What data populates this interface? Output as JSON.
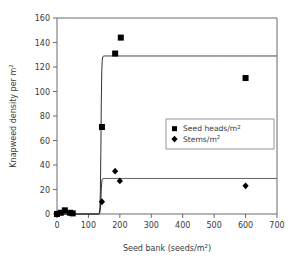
{
  "chart_data": {
    "type": "scatter",
    "title": "",
    "xlabel": "Seed bank (seeds/m2)",
    "xlabel_base": "Seed bank (seeds/m",
    "xlabel_sup": "2",
    "xlabel_tail": ")",
    "ylabel_base": "Knapweed density per m",
    "ylabel_sup": "2",
    "xlim": [
      0,
      700
    ],
    "ylim": [
      0,
      160
    ],
    "xticks": [
      0,
      100,
      200,
      300,
      400,
      500,
      600,
      700
    ],
    "yticks": [
      0,
      20,
      40,
      60,
      80,
      100,
      120,
      140,
      160
    ],
    "grid": false,
    "legend_position": "center-right",
    "series": [
      {
        "name": "Seed heads/m2",
        "name_base": "Seed heads/m",
        "name_sup": "2",
        "marker": "square",
        "color": "#000000",
        "points": [
          {
            "x": 0,
            "y": 0
          },
          {
            "x": 12,
            "y": 1
          },
          {
            "x": 25,
            "y": 3
          },
          {
            "x": 42,
            "y": 1
          },
          {
            "x": 50,
            "y": 0.5
          },
          {
            "x": 143,
            "y": 71
          },
          {
            "x": 185,
            "y": 131
          },
          {
            "x": 203,
            "y": 144
          },
          {
            "x": 600,
            "y": 111
          }
        ],
        "fit_plateau": 129,
        "fit_threshold": 140
      },
      {
        "name": "Stems/m2",
        "name_base": "Stems/m",
        "name_sup": "2",
        "marker": "diamond",
        "color": "#000000",
        "points": [
          {
            "x": 0,
            "y": 0
          },
          {
            "x": 143,
            "y": 10
          },
          {
            "x": 185,
            "y": 35
          },
          {
            "x": 200,
            "y": 27
          },
          {
            "x": 600,
            "y": 23
          }
        ],
        "fit_plateau": 29,
        "fit_threshold": 140
      }
    ]
  },
  "colors": {
    "axis": "#6b6b6b",
    "ink": "#000000",
    "text": "#3a3a3a",
    "background": "#ffffff",
    "legend_border": "#8a8a8a"
  }
}
